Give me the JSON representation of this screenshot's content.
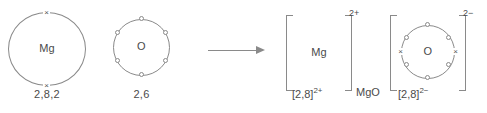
{
  "diagram": {
    "colors": {
      "stroke": "#8a8a8a",
      "text": "#4a4a4a",
      "background": "#ffffff"
    },
    "reactants": {
      "magnesium": {
        "symbol": "Mg",
        "configuration": "2,8,2",
        "electron_marker": "cross",
        "outer_electron_count": 2,
        "electron_glyph": "×"
      },
      "oxygen": {
        "symbol": "O",
        "configuration": "2,6",
        "electron_marker": "dot",
        "outer_electron_count": 6
      }
    },
    "arrow": {
      "name": "reaction-arrow",
      "direction": "right"
    },
    "products": {
      "compound_formula": "MgO",
      "magnesium_ion": {
        "symbol": "Mg",
        "bracket_charge": "2+",
        "configuration_label": "[2,8]",
        "configuration_charge": "2+",
        "outer_electron_count": 0
      },
      "oxide_ion": {
        "symbol": "O",
        "bracket_charge": "2−",
        "configuration_label": "[2,8]",
        "configuration_charge": "2−",
        "own_electron_count": 6,
        "transferred_electron_count": 2,
        "own_electron_glyph": "○",
        "transferred_electron_glyph": "×"
      }
    }
  }
}
